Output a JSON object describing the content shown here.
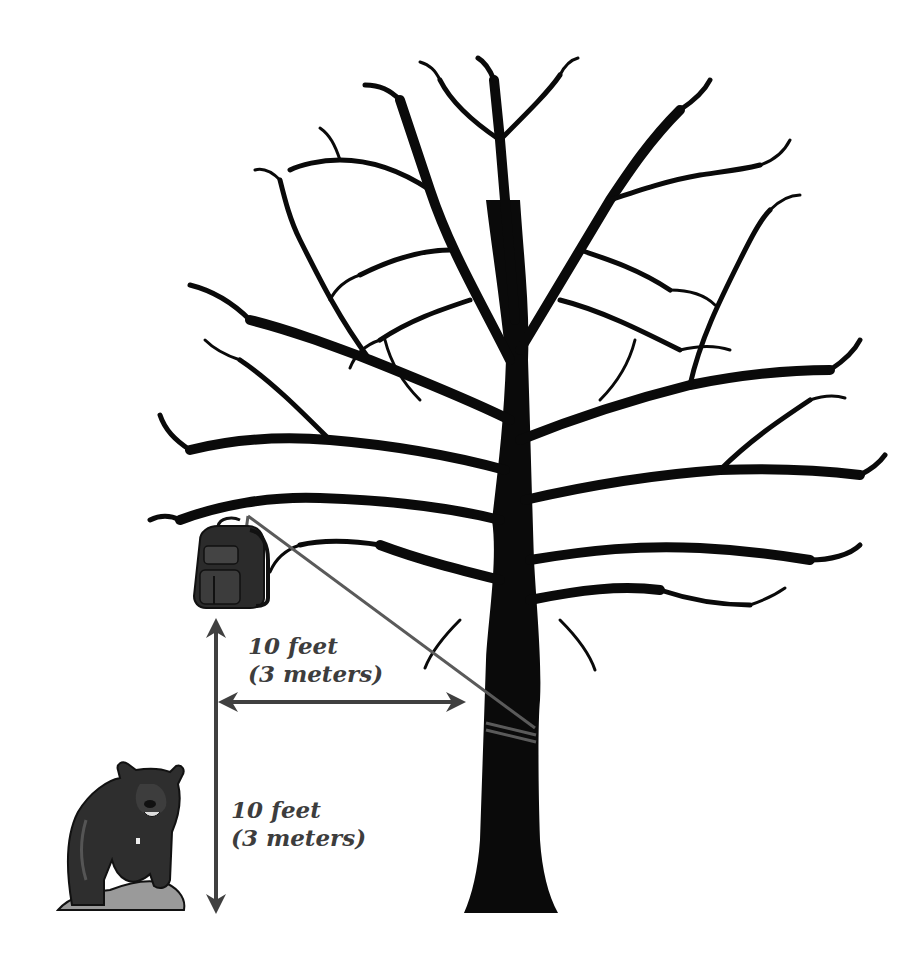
{
  "diagram": {
    "elements": {
      "tree": {
        "icon": "bare-tree-silhouette",
        "color": "#0a0a0a"
      },
      "backpack": {
        "icon": "backpack-icon",
        "color": "#3a3a3a"
      },
      "rope": {
        "icon": "rope",
        "color": "#5a5a5a"
      },
      "bear": {
        "icon": "bear-icon",
        "color": "#2e2e2e"
      },
      "rock": {
        "icon": "rock-icon",
        "color": "#9a9a9a"
      }
    },
    "measurements": {
      "horizontal": {
        "line1": "10 feet",
        "line2": "(3 meters)",
        "meaning": "distance from bag to tree trunk"
      },
      "vertical": {
        "line1": "10 feet",
        "line2": "(3 meters)",
        "meaning": "height of bag above ground"
      }
    },
    "colors": {
      "arrow": "#404040",
      "label_text": "#3d3d3d",
      "background": "#ffffff"
    }
  }
}
